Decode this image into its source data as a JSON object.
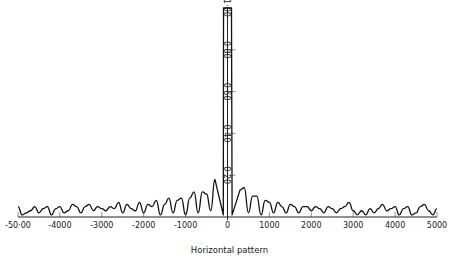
{
  "chart_data": {
    "type": "line",
    "title": "",
    "xlabel": "Horizontal pattern",
    "ylabel": "",
    "xlim": [
      -5000,
      5000
    ],
    "ylim": [
      0,
      1.0
    ],
    "grid": false,
    "legend": null,
    "x_ticks": [
      -5000,
      -4000,
      -3000,
      -2000,
      -1000,
      0,
      1000,
      2000,
      3000,
      4000,
      5000
    ],
    "x_tick_labels": [
      "-50·00",
      "-4000",
      "-3000",
      "-2000",
      "-1000",
      "0",
      "1000",
      "2000",
      "3000",
      "4000",
      "5000"
    ],
    "y_ticks": [
      0.2,
      0.4,
      0.6,
      0.8,
      1.0
    ],
    "y_tick_labels": [
      "0·20",
      "0·40",
      "0·60",
      "0·80",
      "1·00"
    ],
    "series": [
      {
        "name": "Horizontal pattern",
        "x": [
          -5000,
          -4900,
          -4800,
          -4700,
          -4600,
          -4500,
          -4400,
          -4300,
          -4200,
          -4100,
          -4000,
          -3900,
          -3800,
          -3700,
          -3600,
          -3500,
          -3400,
          -3300,
          -3200,
          -3100,
          -3000,
          -2900,
          -2800,
          -2700,
          -2600,
          -2500,
          -2400,
          -2300,
          -2200,
          -2100,
          -2000,
          -1900,
          -1800,
          -1700,
          -1600,
          -1500,
          -1400,
          -1300,
          -1200,
          -1100,
          -1000,
          -900,
          -800,
          -700,
          -600,
          -500,
          -400,
          -300,
          -200,
          -100,
          0,
          100,
          200,
          300,
          400,
          500,
          600,
          700,
          800,
          900,
          1000,
          1100,
          1200,
          1300,
          1400,
          1500,
          1600,
          1700,
          1800,
          1900,
          2000,
          2100,
          2200,
          2300,
          2400,
          2500,
          2600,
          2700,
          2800,
          2900,
          3000,
          3100,
          3200,
          3300,
          3400,
          3500,
          3600,
          3700,
          3800,
          3900,
          4000,
          4100,
          4200,
          4300,
          4400,
          4500,
          4600,
          4700,
          4800,
          4900,
          5000
        ],
        "y": [
          0.05,
          0.01,
          0.02,
          0.03,
          0.05,
          0.02,
          0.04,
          0.05,
          0.01,
          0.04,
          0.05,
          0.02,
          0.03,
          0.06,
          0.05,
          0.02,
          0.05,
          0.06,
          0.03,
          0.05,
          0.04,
          0.03,
          0.05,
          0.04,
          0.07,
          0.02,
          0.06,
          0.04,
          0.03,
          0.07,
          0.02,
          0.06,
          0.05,
          0.08,
          0.01,
          0.06,
          0.09,
          0.02,
          0.08,
          0.09,
          0.01,
          0.09,
          0.12,
          0.02,
          0.12,
          0.11,
          0.03,
          0.18,
          0.01,
          1.0,
          1.0,
          1.0,
          0.01,
          0.13,
          0.14,
          0.02,
          0.1,
          0.1,
          0.01,
          0.08,
          0.07,
          0.02,
          0.07,
          0.05,
          0.02,
          0.06,
          0.05,
          0.02,
          0.05,
          0.05,
          0.03,
          0.05,
          0.04,
          0.02,
          0.05,
          0.04,
          0.02,
          0.04,
          0.05,
          0.07,
          0.03,
          0.01,
          0.03,
          0.01,
          0.04,
          0.02,
          0.04,
          0.06,
          0.03,
          0.04,
          0.05,
          0.01,
          0.04,
          0.05,
          0.01,
          0.02,
          0.05,
          0.06,
          0.03,
          0.01,
          0.04
        ]
      }
    ],
    "main_beam": {
      "from": -300,
      "to": 300,
      "peak": 1.0
    }
  }
}
